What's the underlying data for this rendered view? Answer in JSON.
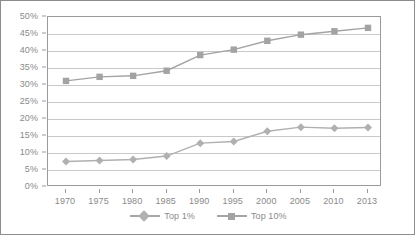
{
  "chart_data": {
    "type": "line",
    "title": "",
    "subtitle": "",
    "xlabel": "",
    "ylabel": "",
    "grid": true,
    "legend_position": "bottom",
    "categories": [
      "1970",
      "1975",
      "1980",
      "1985",
      "1990",
      "1995",
      "2000",
      "2005",
      "2010",
      "2013"
    ],
    "x": [
      1970,
      1975,
      1980,
      1985,
      1990,
      1995,
      2000,
      2005,
      2010,
      2013
    ],
    "ylim": [
      0,
      50
    ],
    "ytick_labels": [
      "0%",
      "5%",
      "10%",
      "15%",
      "20%",
      "25%",
      "30%",
      "35%",
      "40%",
      "45%",
      "50%"
    ],
    "ytick_values": [
      0,
      5,
      10,
      15,
      20,
      25,
      30,
      35,
      40,
      45,
      50
    ],
    "series": [
      {
        "name": "Top 1%",
        "marker": "diamond",
        "color": "#b0b0b0",
        "values": [
          7.5,
          7.8,
          8.1,
          9.1,
          12.9,
          13.4,
          16.4,
          17.6,
          17.3,
          17.5
        ]
      },
      {
        "name": "Top 10%",
        "marker": "square",
        "color": "#a3a3a3",
        "values": [
          31.2,
          32.4,
          32.7,
          34.2,
          38.8,
          40.4,
          43.0,
          44.8,
          45.8,
          46.8
        ]
      }
    ]
  },
  "legend": {
    "entries": [
      {
        "label": "Top 1%"
      },
      {
        "label": "Top 10%"
      }
    ]
  },
  "colors": {
    "series_top1": "#b0b0b0",
    "series_top10": "#a3a3a3",
    "gridline": "#c9c9c9",
    "axis": "#9a9a9a",
    "text": "#8a8a8a",
    "frame": "#8c8c8c",
    "background": "#ffffff"
  }
}
